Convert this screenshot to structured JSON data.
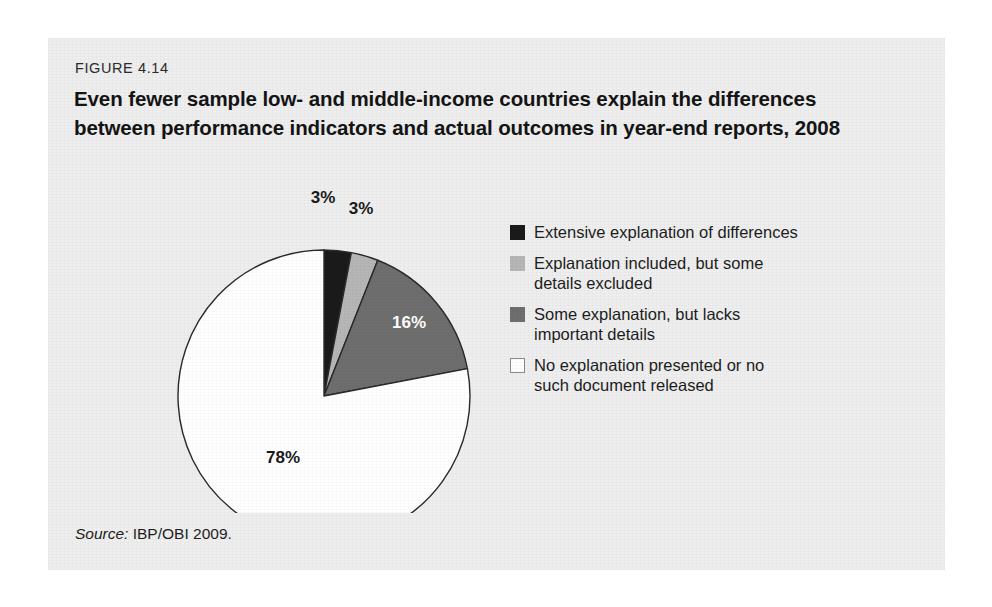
{
  "figure": {
    "number": "FIGURE 4.14",
    "title": "Even fewer sample low- and middle-income countries explain the differences between performance indicators and actual outcomes in year-end reports, 2008",
    "source_lead": "Source:",
    "source_text": " IBP/OBI 2009."
  },
  "legend": {
    "items": [
      {
        "label": "Extensive explanation of differences",
        "color": "#1a1a1a",
        "swatch_name": "legend-swatch-extensive"
      },
      {
        "label": "Explanation included, but some\ndetails excluded",
        "color": "#b6b6b6",
        "swatch_name": "legend-swatch-some-details-excluded"
      },
      {
        "label": "Some explanation, but lacks\nimportant details",
        "color": "#6e6e6e",
        "swatch_name": "legend-swatch-lacks-important-details"
      },
      {
        "label": "No explanation presented or no\nsuch document released",
        "color": "#ffffff",
        "swatch_name": "legend-swatch-no-explanation"
      }
    ]
  },
  "pie_labels": {
    "slice1": "3%",
    "slice2": "3%",
    "slice3": "16%",
    "slice4": "78%"
  },
  "chart_data": {
    "type": "pie",
    "title": "Even fewer sample low- and middle-income countries explain the differences between performance indicators and actual outcomes in year-end reports, 2008",
    "subtitle": "FIGURE 4.14",
    "unit": "percent",
    "start_angle_deg": 0,
    "direction": "clockwise",
    "legend_position": "right",
    "grid": false,
    "labels": [
      "Extensive explanation of differences",
      "Explanation included, but some details excluded",
      "Some explanation, but lacks important details",
      "No explanation presented or no such document released"
    ],
    "values": [
      3,
      3,
      16,
      78
    ],
    "data_labels": [
      "3%",
      "3%",
      "16%",
      "78%"
    ],
    "colors": [
      "#1a1a1a",
      "#b6b6b6",
      "#6e6e6e",
      "#ffffff"
    ],
    "source": "Source: IBP/OBI 2009."
  }
}
